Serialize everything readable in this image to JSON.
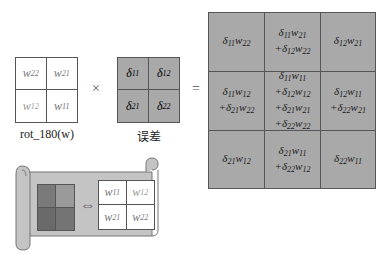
{
  "rot_matrix": {
    "caption": "rot_180(w)",
    "cells": [
      {
        "base": "w",
        "sub": "22"
      },
      {
        "base": "w",
        "sub": "21"
      },
      {
        "base": "w",
        "sub": "12"
      },
      {
        "base": "w",
        "sub": "11"
      }
    ]
  },
  "multiply_symbol": "×",
  "error_matrix": {
    "caption": "误差",
    "cells": [
      {
        "base": "δ",
        "sub": "11"
      },
      {
        "base": "δ",
        "sub": "12"
      },
      {
        "base": "δ",
        "sub": "21"
      },
      {
        "base": "δ",
        "sub": "22"
      }
    ]
  },
  "equals_symbol": "=",
  "result_matrix": {
    "cells": [
      [
        "δ11w22"
      ],
      [
        "δ11w21",
        "+δ12w22"
      ],
      [
        "δ12w21"
      ],
      [
        "δ11w12",
        "+δ21w22"
      ],
      [
        "δ11w11",
        "+δ12w12",
        "+δ21w21",
        "+δ22w22"
      ],
      [
        "δ12w11",
        "+δ22w21"
      ],
      [
        "δ21w12"
      ],
      [
        "δ21w11",
        "+δ22w12"
      ],
      [
        "δ22w11"
      ]
    ]
  },
  "scroll": {
    "arrow_symbol": "⇔",
    "kernel_shades": [
      "#7a7a7a",
      "#9a9a9a",
      "#6a6a6a",
      "#747474"
    ],
    "w_cells": [
      {
        "base": "w",
        "sub": "11"
      },
      {
        "base": "w",
        "sub": "12"
      },
      {
        "base": "w",
        "sub": "21"
      },
      {
        "base": "w",
        "sub": "22"
      }
    ]
  },
  "colors": {
    "gray_fill": "#a9a9a9",
    "scroll_fill": "#c4c4c4",
    "border": "#555555"
  }
}
